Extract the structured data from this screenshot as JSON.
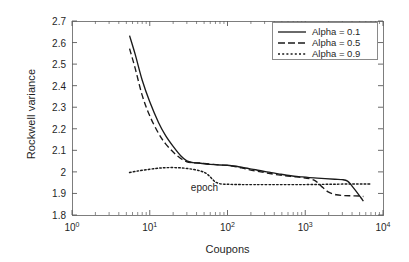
{
  "chart_data": {
    "type": "line",
    "title": "",
    "xlabel": "Coupons",
    "ylabel": "Rockwell variance",
    "xscale": "log",
    "yscale": "linear",
    "xlim": [
      1,
      10000
    ],
    "ylim": [
      1.8,
      2.7
    ],
    "grid": false,
    "legend_position": "upper right",
    "xtick_labels": [
      "10",
      "10",
      "10",
      "10",
      "10"
    ],
    "xtick_exponents": [
      "0",
      "1",
      "2",
      "3",
      "4"
    ],
    "xtick_values": [
      1,
      10,
      100,
      1000,
      10000
    ],
    "ytick_labels": [
      "1.8",
      "1.9",
      "2",
      "2.1",
      "2.2",
      "2.3",
      "2.4",
      "2.5",
      "2.6",
      "2.7"
    ],
    "ytick_values": [
      1.8,
      1.9,
      2.0,
      2.1,
      2.2,
      2.3,
      2.4,
      2.5,
      2.6,
      2.7
    ],
    "annotations": [
      {
        "text": "epoch",
        "x": 30,
        "y": 1.925
      }
    ],
    "series": [
      {
        "name": "Alpha = 0.1",
        "style": "solid",
        "color": "#1a1a1a",
        "x": [
          5.5,
          6.5,
          8,
          10,
          13,
          16,
          20,
          25,
          30,
          36,
          45,
          60,
          80,
          100,
          130,
          170,
          230,
          320,
          450,
          650,
          900,
          1300,
          1800,
          2400,
          3000,
          3500,
          4000,
          4600,
          5200,
          5600
        ],
        "y": [
          2.632,
          2.545,
          2.425,
          2.325,
          2.228,
          2.168,
          2.118,
          2.075,
          2.051,
          2.043,
          2.04,
          2.035,
          2.032,
          2.031,
          2.026,
          2.018,
          2.01,
          2.0,
          1.991,
          1.982,
          1.977,
          1.972,
          1.969,
          1.966,
          1.964,
          1.957,
          1.934,
          1.906,
          1.88,
          1.864
        ]
      },
      {
        "name": "Alpha = 0.5",
        "style": "dashed",
        "color": "#1a1a1a",
        "x": [
          5.5,
          6.5,
          8,
          10,
          13,
          16,
          20,
          25,
          30,
          36,
          45,
          60,
          80,
          100,
          130,
          170,
          230,
          320,
          450,
          650,
          900,
          1150,
          1350,
          1500,
          1700,
          2000,
          2500,
          3200,
          4000,
          5000,
          5600
        ],
        "y": [
          2.572,
          2.48,
          2.355,
          2.26,
          2.178,
          2.13,
          2.092,
          2.062,
          2.047,
          2.043,
          2.041,
          2.036,
          2.032,
          2.03,
          2.024,
          2.014,
          2.004,
          1.995,
          1.986,
          1.979,
          1.974,
          1.968,
          1.958,
          1.944,
          1.926,
          1.906,
          1.894,
          1.89,
          1.889,
          1.888,
          1.886
        ]
      },
      {
        "name": "Alpha = 0.9",
        "style": "dotted",
        "color": "#1a1a1a",
        "x": [
          5.5,
          7,
          9,
          12,
          15,
          19,
          24,
          30,
          37,
          45,
          52,
          58,
          64,
          70,
          78,
          90,
          110,
          150,
          220,
          350,
          600,
          1000,
          1600,
          2500,
          4000,
          5600,
          7000
        ],
        "y": [
          1.997,
          2.004,
          2.01,
          2.016,
          2.019,
          2.02,
          2.019,
          2.016,
          2.011,
          2.004,
          1.995,
          1.982,
          1.966,
          1.953,
          1.946,
          1.943,
          1.942,
          1.941,
          1.941,
          1.941,
          1.941,
          1.941,
          1.942,
          1.943,
          1.944,
          1.944,
          1.944
        ]
      }
    ]
  },
  "legend": {
    "items": [
      {
        "label": "Alpha = 0.1",
        "style": "solid"
      },
      {
        "label": "Alpha = 0.5",
        "style": "dashed"
      },
      {
        "label": "Alpha = 0.9",
        "style": "dotted"
      }
    ]
  }
}
